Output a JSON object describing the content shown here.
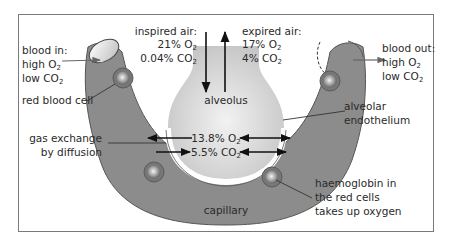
{
  "diagram": {
    "colors": {
      "capillary": "#8a8a8a",
      "capillary_dark": "#6e6e6e",
      "alveolus": "#d4d4d4",
      "endothelium": "#ffffff",
      "frame": "#7a7a7a",
      "text": "#2a2a2a",
      "arrow": "#111111"
    },
    "labels": {
      "blood_in": {
        "line1": "blood in:",
        "o2_prefix": "high O",
        "o2_sub": "2",
        "co2_prefix": "low CO",
        "co2_sub": "2"
      },
      "blood_out": {
        "line1": "blood out:",
        "o2_prefix": "high O",
        "o2_sub": "2",
        "co2_prefix": "low CO",
        "co2_sub": "2"
      },
      "red_blood_cell": "red blood cell",
      "inspired": {
        "line1": "inspired air:",
        "o2_prefix": "21% O",
        "o2_sub": "2",
        "co2_prefix": "0.04% CO",
        "co2_sub": "2"
      },
      "expired": {
        "line1": "expired air:",
        "o2_prefix": "17% O",
        "o2_sub": "2",
        "co2_prefix": "4% CO",
        "co2_sub": "2"
      },
      "alveolus": "alveolus",
      "alveolar_endothelium": {
        "line1": "alveolar",
        "line2": "endothelium"
      },
      "gas_exchange": {
        "line1": "gas exchange",
        "line2": "by diffusion"
      },
      "alveolar_o2": {
        "prefix": "13.8% O",
        "sub": "2"
      },
      "alveolar_co2": {
        "prefix": "5.5% CO",
        "sub": "2"
      },
      "capillary": "capillary",
      "haemoglobin": {
        "line1": "haemoglobin in",
        "line2": "the red cells",
        "line3": "takes up oxygen"
      }
    }
  }
}
